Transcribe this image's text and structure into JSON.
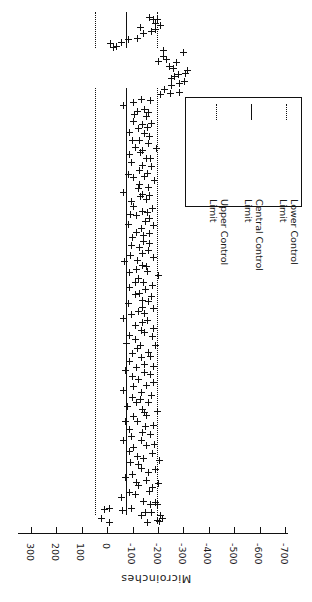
{
  "chart_data": {
    "type": "scatter",
    "orientation": "rotated-180",
    "title": "",
    "xlabel": "Microinches",
    "ylabel": "",
    "axis_ticks": [
      300,
      200,
      100,
      0,
      -100,
      -200,
      -300,
      -400,
      -500,
      -600,
      -700
    ],
    "axis_tick_labels": [
      "300",
      "200",
      "100",
      "0",
      "-100",
      "-200",
      "-300",
      "-400",
      "-500",
      "-600",
      "-700"
    ],
    "axis_range": [
      300,
      -700
    ],
    "grid": false,
    "legend_position": "right-middle",
    "control_limits": {
      "upper_control_limit": 50,
      "central_control_limit": -73,
      "lower_control_limit": -196
    },
    "legend_entries": [
      {
        "name": "Upper Control Limit",
        "line1": "Upper Control",
        "line2": "Limit",
        "style": "dotted"
      },
      {
        "name": "Central Control Limit",
        "line1": "Central Control",
        "line2": "Limit",
        "style": "solid"
      },
      {
        "name": "Lower Control Limit",
        "line1": "Lower Control",
        "line2": "Limit",
        "style": "dotted"
      }
    ],
    "marker_symbol": "+",
    "series_name": "Measurements",
    "values": [
      -155,
      -192,
      -140,
      -210,
      -150,
      -55,
      -95,
      -180,
      -200,
      -145,
      -60,
      -105,
      -85,
      -165,
      -175,
      -130,
      -120,
      -195,
      -150,
      -70,
      -100,
      -160,
      -185,
      -135,
      -115,
      -90,
      -205,
      -145,
      -125,
      -170,
      -80,
      -110,
      -155,
      -190,
      -140,
      -65,
      -100,
      -175,
      -130,
      -95,
      -150,
      -185,
      -120,
      -75,
      -105,
      -160,
      -145,
      -200,
      -135,
      -85,
      -115,
      -170,
      -125,
      -95,
      -180,
      -140,
      -60,
      -110,
      -155,
      -190,
      -130,
      -100,
      -165,
      -145,
      -75,
      -120,
      -185,
      -150,
      -90,
      -135,
      -175,
      -105,
      -160,
      -125,
      -195,
      -140,
      -80,
      -115,
      -170,
      -95,
      -150,
      -130,
      -185,
      -110,
      -145,
      -165,
      -70,
      -100,
      -155,
      -120,
      -190,
      -135,
      -85,
      -160,
      -140,
      -175,
      -105,
      -125,
      -150,
      -95,
      -180,
      -115,
      -145,
      -130,
      -200,
      -90,
      -165,
      -110,
      -155,
      -135,
      -75,
      -120,
      -185,
      -100,
      -145,
      -170,
      -125,
      -95,
      -160,
      -140,
      -105,
      -150,
      -175,
      -115,
      -130,
      -190,
      -85,
      -145,
      -165,
      -120,
      -100,
      -155,
      -135,
      -180,
      -110,
      -95,
      -150,
      -125,
      -170,
      -140,
      -60,
      -115,
      -160,
      -130,
      -185,
      -105,
      -145,
      -90,
      -155,
      -120,
      -175,
      -135,
      -100,
      -165,
      -150,
      -80,
      -125,
      -140,
      -195,
      -110,
      -160,
      -130,
      -105,
      -170,
      -145,
      -85,
      -120,
      -155,
      -135,
      -180,
      -95,
      -150,
      -115,
      -165,
      -125,
      -140,
      -70,
      -105,
      -175,
      -130,
      -215,
      -250,
      -275,
      -230,
      -260,
      -290,
      -310,
      -245,
      -265,
      -285,
      -300,
      -320,
      -255,
      -240,
      -270,
      -205,
      -235,
      -225,
      -295,
      -215,
      -30,
      -45,
      -10,
      -60,
      -90,
      -120,
      -140,
      -175,
      -195,
      -130,
      -215,
      -190,
      -205,
      -180,
      -160
    ],
    "extreme_points": [
      25,
      10,
      -15,
      -5,
      -200,
      -195,
      -185,
      -180,
      -215
    ]
  }
}
